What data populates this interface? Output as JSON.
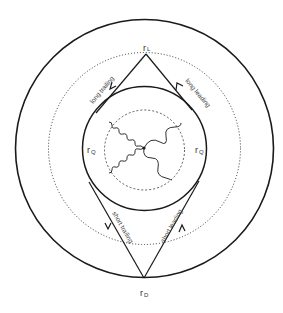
{
  "diagram": {
    "type": "orbital path diagram (concentric circles)",
    "colors": {
      "stroke": "#1a1a1a",
      "text": "#333333",
      "background": "#ffffff"
    },
    "circles": {
      "outer": {
        "style": "solid"
      },
      "middle": {
        "style": "dotted"
      },
      "inner": {
        "style": "solid"
      },
      "core": {
        "style": "dashed"
      }
    },
    "labels": {
      "r_L": {
        "main": "r",
        "sub": "L"
      },
      "r_D": {
        "main": "r",
        "sub": "D"
      },
      "r_Q_left": {
        "main": "r",
        "sub": "Q"
      },
      "r_Q_right": {
        "main": "r",
        "sub": "Q"
      }
    },
    "path_labels": {
      "long_trailing": "long trailing",
      "long_leading": "long leading",
      "short_trailing": "short trailing",
      "short_leading": "short leading"
    },
    "wavy_paths": 4
  }
}
